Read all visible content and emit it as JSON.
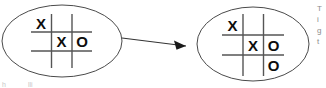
{
  "diagram": {
    "type": "state-transition",
    "nodes": [
      {
        "id": "state-before",
        "name": "left-state",
        "label": "Tic-tac-toe board before move",
        "grid": {
          "rows": 3,
          "cols": 3,
          "cells": [
            [
              "X",
              "",
              ""
            ],
            [
              "",
              "X",
              "O"
            ],
            [
              "",
              "",
              ""
            ]
          ]
        }
      },
      {
        "id": "state-after",
        "name": "right-state",
        "label": "Tic-tac-toe board after move",
        "grid": {
          "rows": 3,
          "cols": 3,
          "cells": [
            [
              "X",
              "",
              ""
            ],
            [
              "",
              "X",
              "O"
            ],
            [
              "",
              "",
              "O"
            ]
          ]
        }
      }
    ],
    "edges": [
      {
        "id": "edge-1",
        "from": "state-before",
        "to": "state-after",
        "label": "",
        "arrowhead": "filled-triangle"
      }
    ],
    "colors": {
      "ellipse_stroke": "#4a4a4a",
      "grid_stroke": "#555555",
      "mark_fill": "#0d0d0d",
      "edge_stroke": "#333333",
      "background": "#ffffff",
      "side_note": "#8c8c8c"
    }
  },
  "side_note": {
    "lines": [
      "T",
      "i",
      "g",
      "t"
    ]
  },
  "bottom_note": {
    "lines": [
      "h",
      "lli"
    ]
  }
}
